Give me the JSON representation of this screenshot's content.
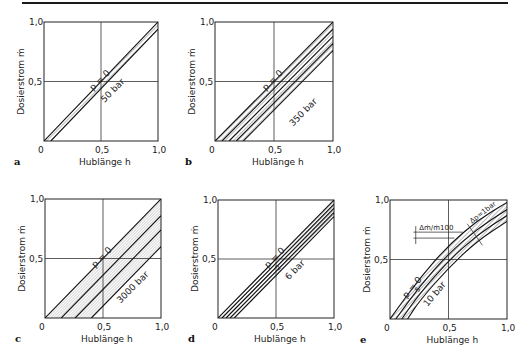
{
  "figure": {
    "panels": [
      {
        "letter": "a",
        "ylabel": "Dosierstrom ṁ",
        "xlabel": "Hublänge h",
        "xticks": [
          "0",
          "0,5",
          "1,0"
        ],
        "yticks": [
          "0,5",
          "1,0"
        ],
        "label_top": "p = 0",
        "label_bottom": "50 bar"
      },
      {
        "letter": "b",
        "ylabel": "Dosierstrom ṁ",
        "xlabel": "Hublänge h",
        "xticks": [
          "0",
          "0,5",
          "1,0"
        ],
        "yticks": [
          "0,5",
          "1,0"
        ],
        "label_top": "p = 0",
        "label_bottom": "350 bar"
      },
      {
        "letter": "c",
        "ylabel": "Dosierstrom ṁ",
        "xlabel": "Hublänge h",
        "xticks": [
          "0",
          "0,5",
          "1,0"
        ],
        "yticks": [
          "0,5",
          "1,0"
        ],
        "label_top": "p = 0",
        "label_bottom": "3000 bar"
      },
      {
        "letter": "d",
        "ylabel": "Dosierstrom ṁ",
        "xlabel": "Hublänge h",
        "xticks": [
          "0",
          "0,5",
          "1,0"
        ],
        "yticks": [
          "0,5",
          "1,0"
        ],
        "label_top": "p = 0",
        "label_mid": "2",
        "label_bottom": "6 bar"
      },
      {
        "letter": "e",
        "ylabel": "Dosierstrom ṁ",
        "xlabel": "Hublänge h",
        "xticks": [
          "0",
          "0,5",
          "1,0"
        ],
        "yticks": [
          "0,5",
          "1,0"
        ],
        "label_top": "p = 0",
        "label_mid": "5",
        "label_bottom": "10 bar",
        "annotation_delta_m": "Δṁ/ṁ100",
        "annotation_delta_p": "Δp=1bar"
      }
    ]
  },
  "chart_data": [
    {
      "type": "line",
      "title": "a",
      "xlabel": "Hublänge h",
      "ylabel": "Dosierstrom ṁ",
      "xlim": [
        0,
        1.0
      ],
      "ylim": [
        0,
        1.0
      ],
      "grid": "center lines at 0.5",
      "series": [
        {
          "name": "p = 0",
          "x": [
            0.0,
            1.0
          ],
          "y": [
            0.0,
            1.0
          ]
        },
        {
          "name": "50 bar",
          "x": [
            0.06,
            1.0
          ],
          "y": [
            0.0,
            0.94
          ]
        }
      ],
      "bands_hatched": 1
    },
    {
      "type": "line",
      "title": "b",
      "xlabel": "Hublänge h",
      "ylabel": "Dosierstrom ṁ",
      "xlim": [
        0,
        1.0
      ],
      "ylim": [
        0,
        1.0
      ],
      "grid": "center lines at 0.5",
      "series": [
        {
          "name": "p = 0",
          "x": [
            0.0,
            1.0
          ],
          "y": [
            0.0,
            1.0
          ]
        },
        {
          "name": "",
          "x": [
            0.06,
            1.0
          ],
          "y": [
            0.0,
            0.94
          ]
        },
        {
          "name": "",
          "x": [
            0.12,
            1.0
          ],
          "y": [
            0.0,
            0.88
          ]
        },
        {
          "name": "",
          "x": [
            0.18,
            1.0
          ],
          "y": [
            0.0,
            0.82
          ]
        },
        {
          "name": "350 bar",
          "x": [
            0.24,
            1.0
          ],
          "y": [
            0.0,
            0.76
          ]
        }
      ],
      "bands_hatched": 4
    },
    {
      "type": "line",
      "title": "c",
      "xlabel": "Hublänge h",
      "ylabel": "Dosierstrom ṁ",
      "xlim": [
        0,
        1.0
      ],
      "ylim": [
        0,
        1.0
      ],
      "grid": "center lines at 0.5",
      "series": [
        {
          "name": "p = 0",
          "x": [
            0.0,
            1.0
          ],
          "y": [
            0.0,
            1.0
          ]
        },
        {
          "name": "",
          "x": [
            0.14,
            1.0
          ],
          "y": [
            0.0,
            0.86
          ]
        },
        {
          "name": "",
          "x": [
            0.26,
            1.0
          ],
          "y": [
            0.0,
            0.74
          ]
        },
        {
          "name": "3000 bar",
          "x": [
            0.4,
            1.0
          ],
          "y": [
            0.0,
            0.6
          ]
        }
      ],
      "bands_hatched": 3
    },
    {
      "type": "line",
      "title": "d",
      "xlabel": "Hublänge h",
      "ylabel": "Dosierstrom ṁ",
      "xlim": [
        0,
        1.0
      ],
      "ylim": [
        0,
        1.0
      ],
      "grid": "center lines at 0.5",
      "series": [
        {
          "name": "p = 0",
          "x": [
            0.0,
            1.0
          ],
          "y": [
            0.0,
            1.0
          ]
        },
        {
          "name": "",
          "x": [
            0.035,
            1.0
          ],
          "y": [
            0.0,
            0.965
          ]
        },
        {
          "name": "2",
          "x": [
            0.07,
            1.0
          ],
          "y": [
            0.0,
            0.93
          ]
        },
        {
          "name": "",
          "x": [
            0.105,
            1.0
          ],
          "y": [
            0.0,
            0.895
          ]
        },
        {
          "name": "6 bar",
          "x": [
            0.14,
            1.0
          ],
          "y": [
            0.0,
            0.86
          ]
        }
      ],
      "bands_hatched": 4
    },
    {
      "type": "line",
      "title": "e",
      "xlabel": "Hublänge h",
      "ylabel": "Dosierstrom ṁ",
      "xlim": [
        0,
        1.0
      ],
      "ylim": [
        0,
        1.0
      ],
      "grid": "center lines at 0.5",
      "series": [
        {
          "name": "p = 0",
          "x": [
            0.0,
            0.25,
            0.5,
            0.75,
            1.0
          ],
          "y": [
            0.0,
            0.34,
            0.62,
            0.83,
            0.98
          ]
        },
        {
          "name": "",
          "x": [
            0.05,
            0.25,
            0.5,
            0.75,
            1.0
          ],
          "y": [
            0.0,
            0.27,
            0.55,
            0.76,
            0.92
          ]
        },
        {
          "name": "5",
          "x": [
            0.1,
            0.25,
            0.5,
            0.75,
            1.0
          ],
          "y": [
            0.0,
            0.21,
            0.49,
            0.71,
            0.87
          ]
        },
        {
          "name": "10 bar",
          "x": [
            0.15,
            0.25,
            0.5,
            0.75,
            1.0
          ],
          "y": [
            0.0,
            0.15,
            0.43,
            0.66,
            0.82
          ]
        }
      ],
      "annotations": [
        "Δṁ/ṁ100",
        "Δp=1bar"
      ],
      "bands_hatched": 3
    }
  ]
}
